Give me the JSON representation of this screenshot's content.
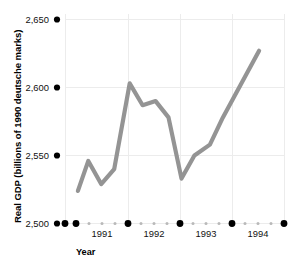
{
  "chart_data": {
    "type": "line",
    "title": "",
    "xlabel": "Year",
    "ylabel": "Real GDP (billions of 1990 deutsche marks)",
    "ylim": [
      2500,
      2650
    ],
    "xlim": [
      1990.75,
      1995.0
    ],
    "grid": true,
    "legend": null,
    "y_ticks": [
      {
        "value": 2650,
        "label": "2,650"
      },
      {
        "value": 2600,
        "label": "2,600"
      },
      {
        "value": 2550,
        "label": "2,550"
      },
      {
        "value": 2500,
        "label": "2,500"
      }
    ],
    "x_major_ticks": [
      {
        "value": 1990.75,
        "label": ""
      },
      {
        "value": 1991.0,
        "label": ""
      },
      {
        "value": 1992.0,
        "label": ""
      },
      {
        "value": 1993.0,
        "label": ""
      },
      {
        "value": 1994.0,
        "label": ""
      },
      {
        "value": 1995.0,
        "label": ""
      }
    ],
    "x_tick_labels": [
      {
        "value": 1991.5,
        "label": "1991"
      },
      {
        "value": 1992.5,
        "label": "1992"
      },
      {
        "value": 1993.5,
        "label": "1993"
      },
      {
        "value": 1994.5,
        "label": "1994"
      }
    ],
    "x_minor_ticks": [
      1991.25,
      1991.5,
      1991.75,
      1992.25,
      1992.5,
      1992.75,
      1993.25,
      1993.5,
      1993.75,
      1994.25,
      1994.5,
      1994.75
    ],
    "series": [
      {
        "name": "Real GDP",
        "color": "#949494",
        "x": [
          1991.0,
          1991.25,
          1991.5,
          1991.75,
          1992.0,
          1992.25,
          1992.5,
          1992.75,
          1993.0,
          1993.25,
          1993.5,
          1993.75,
          1994.0,
          1994.25,
          1994.5,
          1994.75
        ],
        "values": [
          2524,
          2546,
          2529,
          2540,
          2603,
          2587,
          2590,
          2578,
          2533,
          2550,
          2558,
          2578,
          2592,
          2606,
          2627,
          2627
        ]
      }
    ],
    "points": [
      {
        "x": 1991.0,
        "y": 2524
      },
      {
        "x": 1991.2,
        "y": 2546
      },
      {
        "x": 1991.45,
        "y": 2529
      },
      {
        "x": 1991.7,
        "y": 2540
      },
      {
        "x": 1992.0,
        "y": 2603
      },
      {
        "x": 1992.25,
        "y": 2587
      },
      {
        "x": 1992.5,
        "y": 2590
      },
      {
        "x": 1992.75,
        "y": 2578
      },
      {
        "x": 1993.0,
        "y": 2533
      },
      {
        "x": 1993.25,
        "y": 2550
      },
      {
        "x": 1993.55,
        "y": 2558
      },
      {
        "x": 1993.8,
        "y": 2578
      },
      {
        "x": 1994.0,
        "y": 2592
      },
      {
        "x": 1994.5,
        "y": 2627
      }
    ]
  },
  "axes": {
    "y_title": "Real GDP (billions of 1990 deutsche marks)",
    "x_title": "Year"
  }
}
